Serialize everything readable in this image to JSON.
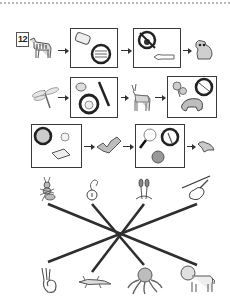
{
  "page": {
    "exercise_number": "12",
    "colors": {
      "ink": "#333333",
      "line": "#2e2e2e",
      "dotted_border": "#b9b9b9",
      "gray_fill": "#bdbdbd"
    }
  },
  "chains": [
    {
      "row": 1,
      "items": [
        {
          "type": "animal",
          "icon": "zebra-icon"
        },
        {
          "type": "box",
          "icons": [
            "eraser-icon",
            "crossed-circle-icon"
          ]
        },
        {
          "type": "box",
          "icons": [
            "crossed-circle-icon",
            "horn-icon"
          ]
        },
        {
          "type": "animal",
          "icon": "raccoon-icon"
        }
      ]
    },
    {
      "row": 2,
      "items": [
        {
          "type": "animal",
          "icon": "dragonfly-icon"
        },
        {
          "type": "box",
          "icons": [
            "coin-icon",
            "brush-icon",
            "crossed-circle-icon"
          ]
        },
        {
          "type": "animal",
          "icon": "deer-icon"
        },
        {
          "type": "box",
          "icons": [
            "flowers-icon",
            "crossed-circle-icon",
            "boar-icon"
          ]
        }
      ]
    },
    {
      "row": 3,
      "items": [
        {
          "type": "box",
          "icons": [
            "crossed-circle-icon",
            "clock-icon",
            "book-icon"
          ]
        },
        {
          "type": "animal",
          "icon": "bat-icon"
        },
        {
          "type": "box",
          "icons": [
            "magnifier-icon",
            "crossed-circle-icon",
            "ball-icon"
          ]
        },
        {
          "type": "animal",
          "icon": "bird-icon"
        }
      ]
    }
  ],
  "matching": {
    "top_items": [
      "ant-icon",
      "pendant-icon",
      "cattails-icon",
      "violin-icon"
    ],
    "bottom_items": [
      "seahorse-icon",
      "lizard-icon",
      "octopus-icon",
      "lion-icon"
    ],
    "connections": [
      {
        "from": "ant-icon",
        "to": "lion-icon"
      },
      {
        "from": "pendant-icon",
        "to": "octopus-icon"
      },
      {
        "from": "cattails-icon",
        "to": "lizard-icon"
      },
      {
        "from": "violin-icon",
        "to": "seahorse-icon"
      }
    ]
  }
}
